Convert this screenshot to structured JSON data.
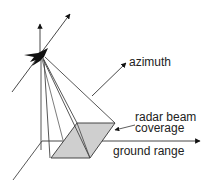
{
  "diagram": {
    "labels": {
      "azimuth": "azimuth",
      "coverage_line1": "radar beam",
      "coverage_line2": "coverage",
      "ground_range": "ground range"
    },
    "icons": {
      "aircraft": "aircraft-silhouette-icon"
    },
    "colors": {
      "line": "#333333",
      "footprint_fill": "#cfcfcf",
      "text": "#222222"
    }
  }
}
